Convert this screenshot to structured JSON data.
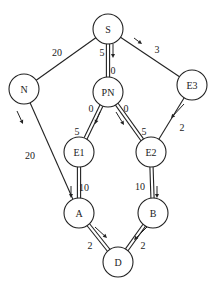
{
  "diagram": {
    "type": "directed-graph",
    "nodes": [
      {
        "id": "S",
        "label": "S",
        "x": 108,
        "y": 29,
        "r": 15
      },
      {
        "id": "N",
        "label": "N",
        "x": 24,
        "y": 89,
        "r": 15
      },
      {
        "id": "PN",
        "label": "PN",
        "x": 108,
        "y": 92,
        "r": 15
      },
      {
        "id": "E3",
        "label": "E3",
        "x": 192,
        "y": 85,
        "r": 15
      },
      {
        "id": "E1",
        "label": "E1",
        "x": 79,
        "y": 152,
        "r": 15
      },
      {
        "id": "E2",
        "label": "E2",
        "x": 151,
        "y": 152,
        "r": 15
      },
      {
        "id": "A",
        "label": "A",
        "x": 79,
        "y": 213,
        "r": 15
      },
      {
        "id": "B",
        "label": "B",
        "x": 153,
        "y": 213,
        "r": 15
      },
      {
        "id": "D",
        "label": "D",
        "x": 118,
        "y": 262,
        "r": 15
      }
    ],
    "edges": [
      {
        "from": "S",
        "to": "N",
        "double": false
      },
      {
        "from": "S",
        "to": "PN",
        "double": true
      },
      {
        "from": "S",
        "to": "E3",
        "double": false
      },
      {
        "from": "N",
        "to": "A",
        "double": false
      },
      {
        "from": "PN",
        "to": "E1",
        "double": true
      },
      {
        "from": "PN",
        "to": "E2",
        "double": true
      },
      {
        "from": "E3",
        "to": "E2",
        "double": false
      },
      {
        "from": "E1",
        "to": "A",
        "double": true
      },
      {
        "from": "E2",
        "to": "B",
        "double": true
      },
      {
        "from": "A",
        "to": "D",
        "double": true
      },
      {
        "from": "B",
        "to": "D",
        "double": true
      }
    ],
    "weights": [
      {
        "text": "20",
        "x": 57,
        "y": 52
      },
      {
        "text": "5",
        "x": 102,
        "y": 52
      },
      {
        "text": "3",
        "x": 157,
        "y": 49
      },
      {
        "text": "0",
        "x": 113,
        "y": 70
      },
      {
        "text": "0",
        "x": 91,
        "y": 108
      },
      {
        "text": "0",
        "x": 126,
        "y": 108
      },
      {
        "text": "5",
        "x": 77,
        "y": 131
      },
      {
        "text": "5",
        "x": 144,
        "y": 131
      },
      {
        "text": "2",
        "x": 182,
        "y": 127
      },
      {
        "text": "20",
        "x": 30,
        "y": 155
      },
      {
        "text": "10",
        "x": 84,
        "y": 187
      },
      {
        "text": "10",
        "x": 140,
        "y": 186
      },
      {
        "text": "2",
        "x": 90,
        "y": 245
      },
      {
        "text": "2",
        "x": 143,
        "y": 245
      }
    ],
    "arrows": [
      {
        "x1": 113,
        "y1": 44,
        "x2": 113,
        "y2": 58
      },
      {
        "x1": 134,
        "y1": 38,
        "x2": 142,
        "y2": 44
      },
      {
        "x1": 17,
        "y1": 111,
        "x2": 23,
        "y2": 124
      },
      {
        "x1": 100,
        "y1": 112,
        "x2": 95,
        "y2": 124
      },
      {
        "x1": 116,
        "y1": 112,
        "x2": 124,
        "y2": 125
      },
      {
        "x1": 184,
        "y1": 104,
        "x2": 171,
        "y2": 118
      },
      {
        "x1": 71,
        "y1": 186,
        "x2": 71,
        "y2": 198
      },
      {
        "x1": 157,
        "y1": 186,
        "x2": 157,
        "y2": 198
      },
      {
        "x1": 95,
        "y1": 227,
        "x2": 107,
        "y2": 238
      },
      {
        "x1": 147,
        "y1": 227,
        "x2": 134,
        "y2": 240
      }
    ]
  }
}
